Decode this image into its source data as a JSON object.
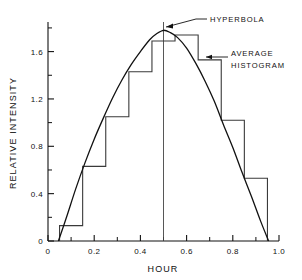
{
  "chart_data": {
    "type": "line",
    "title": "",
    "xlabel": "HOUR",
    "ylabel": "RELATIVE INTENSITY",
    "xlim": [
      0,
      1.0
    ],
    "ylim": [
      0,
      1.85
    ],
    "grid": false,
    "legend_position": "inline-annotations",
    "x_ticks": [
      0,
      0.2,
      0.4,
      0.6,
      0.8,
      1.0
    ],
    "x_tick_labels": [
      "0",
      "0.2",
      "0.4",
      "0.6",
      "0.8",
      "1.0"
    ],
    "x_minor_ticks": [
      0.1,
      0.3,
      0.5,
      0.7,
      0.9
    ],
    "y_ticks": [
      0,
      0.4,
      0.8,
      1.2,
      1.6
    ],
    "y_tick_labels": [
      "0",
      "0.4",
      "0.8",
      "1.2",
      "1.6"
    ],
    "y_minor_ticks": [
      0.2,
      0.6,
      1.0,
      1.4,
      1.8
    ],
    "series": [
      {
        "name": "HYPERBOLA",
        "type": "line",
        "x": [
          0.045,
          0.08,
          0.12,
          0.16,
          0.2,
          0.24,
          0.28,
          0.32,
          0.36,
          0.4,
          0.44,
          0.47,
          0.5,
          0.53,
          0.56,
          0.6,
          0.64,
          0.68,
          0.72,
          0.76,
          0.8,
          0.84,
          0.88,
          0.92,
          0.955
        ],
        "values": [
          0.0,
          0.2,
          0.44,
          0.66,
          0.86,
          1.04,
          1.21,
          1.36,
          1.49,
          1.6,
          1.7,
          1.75,
          1.78,
          1.76,
          1.72,
          1.63,
          1.5,
          1.35,
          1.18,
          0.98,
          0.79,
          0.58,
          0.38,
          0.17,
          0.0
        ]
      },
      {
        "name": "AVERAGE HISTOGRAM",
        "type": "step",
        "bin_edges": [
          0.05,
          0.15,
          0.25,
          0.35,
          0.45,
          0.55,
          0.65,
          0.75,
          0.85,
          0.95
        ],
        "bin_centers": [
          0.1,
          0.2,
          0.3,
          0.4,
          0.5,
          0.6,
          0.7,
          0.8,
          0.9
        ],
        "values": [
          0.13,
          0.63,
          1.05,
          1.43,
          1.69,
          1.74,
          1.53,
          1.02,
          0.53
        ]
      }
    ],
    "annotations": [
      {
        "text": "HYPERBOLA",
        "target_x": 0.5,
        "target_y": 1.78
      },
      {
        "text": "AVERAGE",
        "text_line2": "HISTOGRAM",
        "target_x": 0.65,
        "target_y": 1.53
      }
    ],
    "reference_lines": [
      {
        "orientation": "vertical",
        "x": 0.5,
        "from_y": 0,
        "to_y": 1.85
      }
    ],
    "colors": {
      "axis": "#111111",
      "hyperbola": "#111111",
      "histogram": "#3a3a3a",
      "background": "#ffffff"
    }
  },
  "labels": {
    "x_axis_title": "HOUR",
    "y_axis_title": "RELATIVE INTENSITY",
    "hyperbola": "HYPERBOLA",
    "average": "AVERAGE",
    "histogram": "HISTOGRAM"
  }
}
